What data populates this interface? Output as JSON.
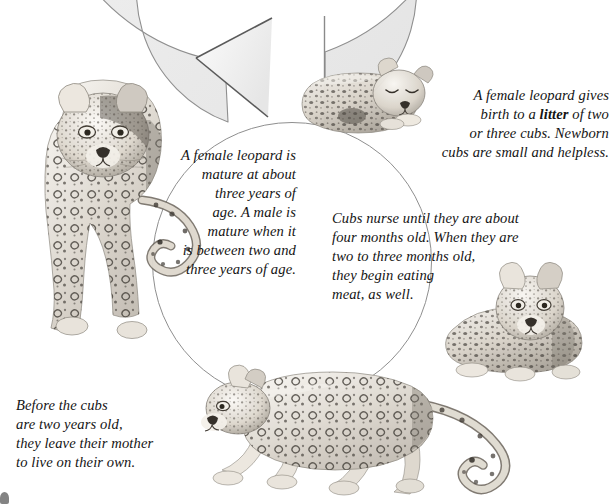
{
  "diagram": {
    "background_color": "#ffffff",
    "ring": {
      "fill_color": "#efefef",
      "inner_fill_color": "#ffffff",
      "stroke_color": "#8c8c8c",
      "direction": "counterclockwise",
      "arrowhead": "left-pointing"
    },
    "text_color": "#141414"
  },
  "captions": {
    "birth": "A female leopard gives\nbirth to a litter of two\nor three cubs. Newborn\ncubs are small and helpless.",
    "birth_pre": "A female leopard gives\nbirth to a ",
    "birth_bold": "litter",
    "birth_post": " of two\nor three cubs. Newborn\ncubs are small and helpless.",
    "nursing": "Cubs nurse until they are about\nfour months old. When they are\ntwo to three months old,\nthey begin eating\nmeat, as well.",
    "leaving": "Before the cubs\nare two years old,\nthey leave their mother\nto live on their own.",
    "mature": "A female leopard is\nmature at about\nthree years of\nage. A male is\nmature when it\nis between two and\nthree years of age."
  },
  "illustrations": {
    "adult_leopard": "adult-leopard-walking-forward",
    "newborn_cub": "newborn-cub-sleeping",
    "young_cub": "young-cub-sitting",
    "juvenile_leopard": "juvenile-leopard-walking-left"
  }
}
